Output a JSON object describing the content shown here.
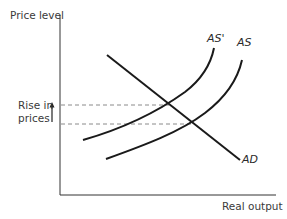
{
  "diagram": {
    "type": "AD-AS shift diagram",
    "axes": {
      "y_label": "Price level",
      "x_label": "Real output"
    },
    "curves": [
      {
        "id": "AD",
        "label": "AD",
        "description": "Aggregate demand, downward sloping"
      },
      {
        "id": "AS",
        "label": "AS",
        "description": "Original aggregate supply, upward sloping"
      },
      {
        "id": "AS_prime",
        "label": "AS'",
        "description": "Shifted aggregate supply (left/up)"
      }
    ],
    "annotation": {
      "line1": "Rise in",
      "line2": "prices",
      "arrow": "up-arrow"
    },
    "equilibria": [
      {
        "name": "original",
        "curves": [
          "AD",
          "AS"
        ],
        "price_level": "lower"
      },
      {
        "name": "new",
        "curves": [
          "AD",
          "AS'"
        ],
        "price_level": "higher"
      }
    ],
    "colors": {
      "line": "#1a1a1a",
      "dashed": "#888888",
      "text": "#3a3a3a"
    }
  }
}
